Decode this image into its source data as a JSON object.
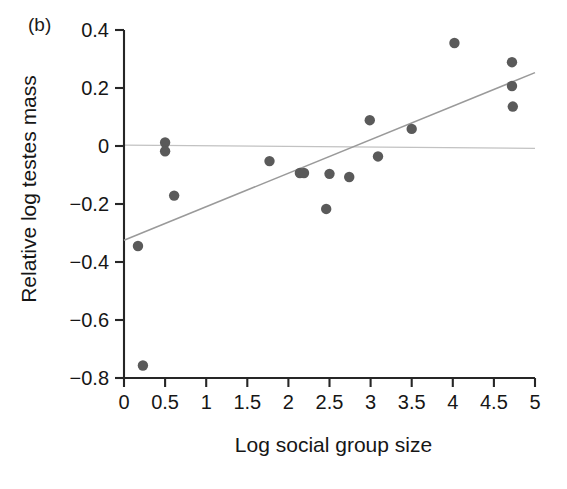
{
  "figure": {
    "panel_label": "(b)"
  },
  "chart_data": {
    "type": "scatter",
    "title": "",
    "xlabel": "Log social group size",
    "ylabel": "Relative log testes mass",
    "xlim": [
      0,
      5
    ],
    "ylim": [
      -0.8,
      0.4
    ],
    "xticks": [
      0,
      0.5,
      1,
      1.5,
      2,
      2.5,
      3,
      3.5,
      4,
      4.5,
      5
    ],
    "xtick_labels": [
      "0",
      "0.5",
      "1",
      "1.5",
      "2",
      "2.5",
      "3",
      "3.5",
      "4",
      "4.5",
      "5"
    ],
    "yticks": [
      0.4,
      0.2,
      0,
      -0.2,
      -0.4,
      -0.6,
      -0.8
    ],
    "ytick_labels": [
      "0.4",
      "0.2",
      "0",
      "−0.2",
      "−0.4",
      "−0.6",
      "−0.8"
    ],
    "grid": false,
    "legend": null,
    "marker_color": "#5a5a5a",
    "marker_size": 5.2,
    "points": [
      {
        "x": 0.17,
        "y": -0.345
      },
      {
        "x": 0.23,
        "y": -0.757
      },
      {
        "x": 0.5,
        "y": 0.012
      },
      {
        "x": 0.5,
        "y": -0.018
      },
      {
        "x": 0.61,
        "y": -0.171
      },
      {
        "x": 1.77,
        "y": -0.052
      },
      {
        "x": 2.14,
        "y": -0.093
      },
      {
        "x": 2.19,
        "y": -0.093
      },
      {
        "x": 2.46,
        "y": -0.217
      },
      {
        "x": 2.5,
        "y": -0.096
      },
      {
        "x": 2.74,
        "y": -0.107
      },
      {
        "x": 2.99,
        "y": 0.089
      },
      {
        "x": 3.09,
        "y": -0.036
      },
      {
        "x": 3.5,
        "y": 0.059
      },
      {
        "x": 4.02,
        "y": 0.355
      },
      {
        "x": 4.72,
        "y": 0.289
      },
      {
        "x": 4.72,
        "y": 0.207
      },
      {
        "x": 4.73,
        "y": 0.136
      }
    ],
    "trend_line": {
      "label": "regression-line",
      "color": "#9a9a9a",
      "x_start": 0.0,
      "y_start": -0.325,
      "x_end": 5.0,
      "y_end": 0.253
    },
    "zero_line": {
      "label": "zero-reference-line",
      "color": "#c2c2c2",
      "y": 0.0,
      "x_start": 0.0,
      "x_end": 5.0,
      "y_start": 0.003,
      "y_end": -0.008
    }
  }
}
